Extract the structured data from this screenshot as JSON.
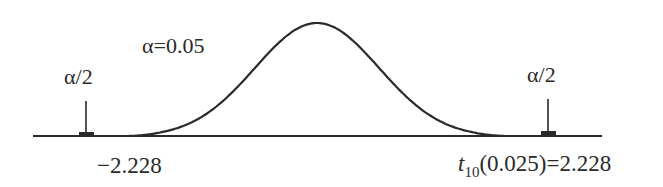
{
  "chart_data": {
    "type": "line",
    "title": "",
    "distribution": "t",
    "degrees_of_freedom": 10,
    "alpha": 0.05,
    "critical_value": 2.228,
    "annotations": {
      "alpha_label": "α=0.05",
      "left_tail_label": "α/2",
      "right_tail_label": "α/2",
      "left_critical_label": "−2.228",
      "right_critical_label_prefix": "t",
      "right_critical_label_sub": "10",
      "right_critical_label_rest": "(0.025)=2.228"
    },
    "x_range": [
      -3.2,
      3.4
    ],
    "line_color": "#2a2a2a"
  }
}
